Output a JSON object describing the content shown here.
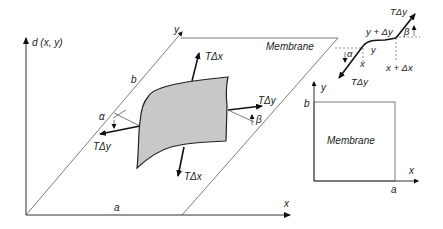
{
  "main_diagram": {
    "axis_d": "d (x, y)",
    "axis_x": "x",
    "axis_y": "y",
    "side_a": "a",
    "side_b": "b",
    "membrane_label": "Membrane",
    "force_top": "TΔx",
    "force_bottom": "TΔx",
    "force_left": "TΔy",
    "force_right": "TΔy",
    "angle_left": "α",
    "angle_right": "β"
  },
  "detail_diagram": {
    "force_top": "TΔy",
    "force_bottom": "TΔy",
    "label_y_plus_dy": "y + Δy",
    "label_y": "y",
    "label_x": "x",
    "label_x_plus_dx": "x + Δx",
    "angle_alpha": "α",
    "angle_beta": "β"
  },
  "plan_view": {
    "axis_y": "y",
    "axis_x": "x",
    "side_a": "a",
    "side_b": "b",
    "membrane_label": "Membrane"
  }
}
